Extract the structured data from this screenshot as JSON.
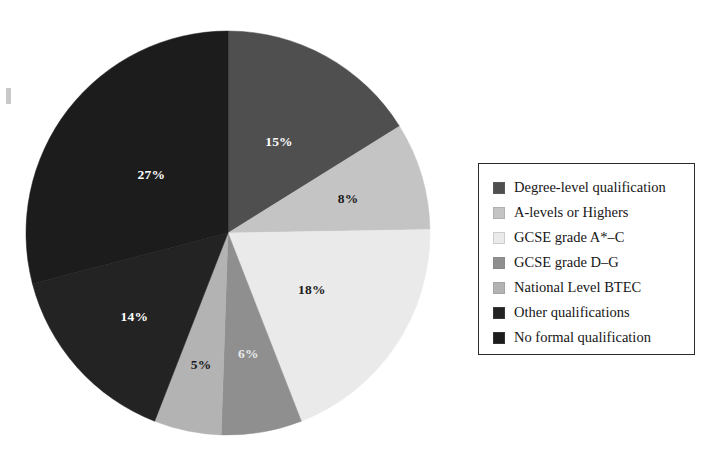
{
  "chart_data": {
    "type": "pie",
    "title": "",
    "subtitle": "",
    "xlabel": "",
    "ylabel": "",
    "legend_position": "right",
    "grid": false,
    "value_suffix": "%",
    "start_angle_deg": 0,
    "direction": "clockwise",
    "categories": [
      "Degree-level qualification",
      "A-levels or Highers",
      "GCSE grade A*–C",
      "GCSE grade D–G",
      "National Level BTEC",
      "Other qualifications",
      "No formal qualification"
    ],
    "values": [
      15,
      8,
      18,
      6,
      5,
      14,
      27
    ],
    "labels": [
      "15%",
      "8%",
      "18%",
      "6%",
      "5%",
      "14%",
      "27%"
    ],
    "colors": [
      "#4f4f4f",
      "#c4c4c4",
      "#eaeaea",
      "#8f8f8f",
      "#b3b3b3",
      "#232323",
      "#1c1c1c"
    ],
    "label_text_colors": [
      "#ffffff",
      "#1a1a1a",
      "#1a1a1a",
      "#e8e8e8",
      "#1a1a1a",
      "#ffffff",
      "#ffffff"
    ],
    "slices": [
      {
        "label": "Degree-level qualification",
        "value": 15,
        "display": "15%",
        "color": "#4f4f4f"
      },
      {
        "label": "A-levels or Highers",
        "value": 8,
        "display": "8%",
        "color": "#c4c4c4"
      },
      {
        "label": "GCSE grade A*–C",
        "value": 18,
        "display": "18%",
        "color": "#eaeaea"
      },
      {
        "label": "GCSE grade D–G",
        "value": 6,
        "display": "6%",
        "color": "#8f8f8f"
      },
      {
        "label": "National Level BTEC",
        "value": 5,
        "display": "5%",
        "color": "#b3b3b3"
      },
      {
        "label": "Other qualifications",
        "value": 14,
        "display": "14%",
        "color": "#232323"
      },
      {
        "label": "No formal qualification",
        "value": 27,
        "display": "27%",
        "color": "#1c1c1c"
      }
    ]
  },
  "pie": {
    "slice_labels": {
      "degree_level": "15%",
      "a_levels": "8%",
      "gcse_a_c": "18%",
      "gcse_d_g": "6%",
      "btec": "5%",
      "other": "14%",
      "no_formal": "27%"
    }
  },
  "legend": {
    "items": [
      {
        "label": "Degree-level qualification",
        "color": "#4f4f4f"
      },
      {
        "label": "A-levels or Highers",
        "color": "#c4c4c4"
      },
      {
        "label": "GCSE grade A*–C",
        "color": "#eaeaea"
      },
      {
        "label": "GCSE grade D–G",
        "color": "#8f8f8f"
      },
      {
        "label": "National Level BTEC",
        "color": "#b3b3b3"
      },
      {
        "label": "Other qualifications",
        "color": "#232323"
      },
      {
        "label": "No formal qualification",
        "color": "#1c1c1c"
      }
    ]
  }
}
